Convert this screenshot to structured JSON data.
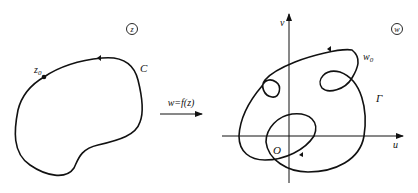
{
  "left_plane": {
    "plane_label": "z",
    "curve_label": "C",
    "point_label": "z",
    "point_subscript": "0"
  },
  "mapping": {
    "label": "w=f(z)"
  },
  "right_plane": {
    "plane_label": "w",
    "curve_label": "Γ",
    "point_label": "w",
    "point_subscript": "0",
    "x_axis_label": "u",
    "y_axis_label": "v",
    "origin_label": "O"
  },
  "colors": {
    "stroke": "#111111",
    "background": "#ffffff"
  }
}
